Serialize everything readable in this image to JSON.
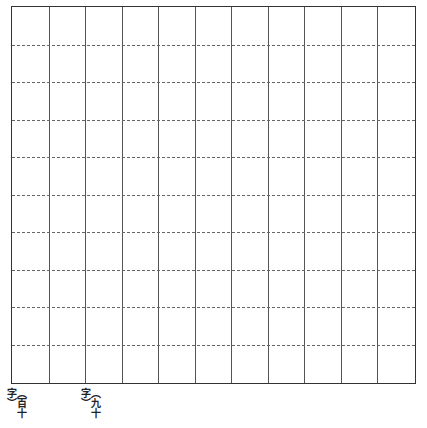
{
  "sheet": {
    "type": "writing-grid",
    "columns": 11,
    "rows": 10,
    "row_style": "dashed",
    "column_style": "solid",
    "line_color": "#555555",
    "border_color": "#333333"
  },
  "markers": [
    {
      "text": "（百十字）",
      "column_index": 0
    },
    {
      "text": "（九十字）",
      "column_index": 2
    }
  ]
}
